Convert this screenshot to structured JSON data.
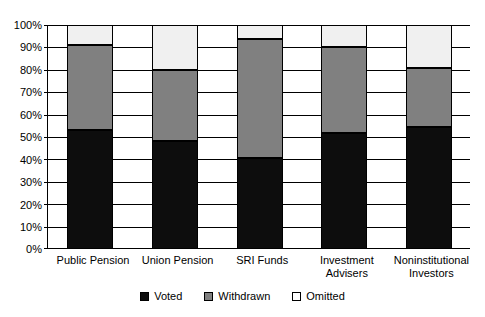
{
  "chart_data": {
    "type": "bar",
    "stacked": true,
    "orientation": "vertical",
    "title": "",
    "subtitle": "",
    "xlabel": "",
    "ylabel": "",
    "ylim": [
      0,
      100
    ],
    "y_unit": "percent",
    "grid": true,
    "legend_position": "bottom",
    "categories": [
      "Public Pension",
      "Union Pension",
      "SRI Funds",
      "Investment Advisers",
      "Noninstitutional Investors"
    ],
    "category_label_lines": [
      [
        "Public Pension"
      ],
      [
        "Union Pension"
      ],
      [
        "SRI Funds"
      ],
      [
        "Investment",
        "Advisers"
      ],
      [
        "Noninstitutional",
        "Investors"
      ]
    ],
    "series": [
      {
        "name": "Voted",
        "color": "#0d0d0d",
        "values": [
          53,
          48,
          40.5,
          52,
          54.5
        ]
      },
      {
        "name": "Withdrawn",
        "color": "#808080",
        "values": [
          38,
          32,
          53.2,
          38,
          26.5
        ]
      },
      {
        "name": "Omitted",
        "color": "#ffffff",
        "values": [
          9,
          20,
          6.3,
          10,
          19
        ]
      }
    ],
    "cumulative_tops": {
      "voted": [
        53,
        48,
        40.5,
        52,
        54.5
      ],
      "withdrawn": [
        91,
        80,
        93.7,
        90,
        81
      ],
      "omitted": [
        100,
        100,
        100,
        100,
        100
      ]
    },
    "yticks": [
      0,
      10,
      20,
      30,
      40,
      50,
      60,
      70,
      80,
      90,
      100
    ],
    "ytick_labels": [
      "0%",
      "10%",
      "20%",
      "30%",
      "40%",
      "50%",
      "60%",
      "70%",
      "80%",
      "90%",
      "100%"
    ],
    "legend_entries": [
      {
        "label": "Voted",
        "swatch": "black-square"
      },
      {
        "label": "Withdrawn",
        "swatch": "gray-square"
      },
      {
        "label": "Omitted",
        "swatch": "white-square"
      }
    ]
  },
  "colors": {
    "voted": "#0d0d0d",
    "withdrawn": "#808080",
    "omitted": "#ffffff",
    "omitted_fill": "#f0f0f0",
    "axis": "#000000",
    "grid": "#000000",
    "background": "#ffffff"
  }
}
